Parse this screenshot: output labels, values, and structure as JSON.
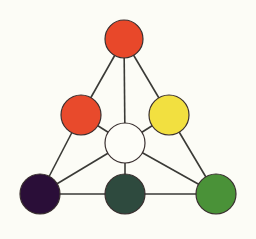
{
  "diagram": {
    "type": "color-triangle",
    "background": "#fcfcf6",
    "line_color": "#3a3a36",
    "outline_color": "#3a3030",
    "nodes": [
      {
        "id": "top",
        "name": "top-red-circle",
        "cx": 124,
        "cy": 39,
        "r": 19,
        "fill": "#e8482a"
      },
      {
        "id": "mid_left",
        "name": "mid-left-red-circle",
        "cx": 81,
        "cy": 115,
        "r": 20,
        "fill": "#e84a2c"
      },
      {
        "id": "mid_right",
        "name": "mid-right-yellow-circle",
        "cx": 169,
        "cy": 115,
        "r": 20,
        "fill": "#f2e040"
      },
      {
        "id": "center",
        "name": "center-white-circle",
        "cx": 125,
        "cy": 143,
        "r": 20,
        "fill": "#fdfdf8"
      },
      {
        "id": "bottom_left",
        "name": "bottom-left-purple-circle",
        "cx": 40,
        "cy": 194,
        "r": 20,
        "fill": "#2a0e38"
      },
      {
        "id": "bottom_center",
        "name": "bottom-center-darkgreen-circle",
        "cx": 125,
        "cy": 194,
        "r": 20,
        "fill": "#2e4a3e"
      },
      {
        "id": "bottom_right",
        "name": "bottom-right-green-circle",
        "cx": 216,
        "cy": 194,
        "r": 20,
        "fill": "#4a9238"
      }
    ],
    "edges": [
      [
        "top",
        "mid_left"
      ],
      [
        "mid_left",
        "bottom_left"
      ],
      [
        "top",
        "mid_right"
      ],
      [
        "mid_right",
        "bottom_right"
      ],
      [
        "top",
        "center"
      ],
      [
        "mid_left",
        "center"
      ],
      [
        "mid_right",
        "center"
      ],
      [
        "center",
        "bottom_left"
      ],
      [
        "center",
        "bottom_center"
      ],
      [
        "center",
        "bottom_right"
      ],
      [
        "bottom_left",
        "bottom_center"
      ],
      [
        "bottom_center",
        "bottom_right"
      ]
    ]
  }
}
